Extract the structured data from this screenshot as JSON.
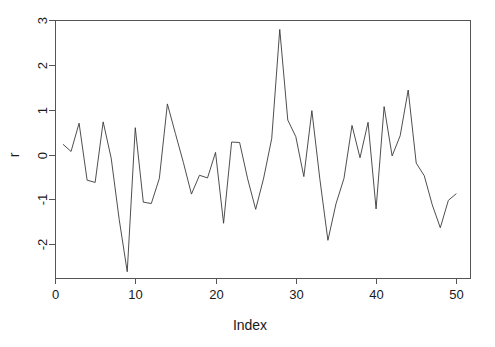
{
  "chart_data": {
    "type": "line",
    "title": "",
    "subtitle": "",
    "xlabel": "Index",
    "ylabel": "r",
    "xlim": [
      0,
      51.7
    ],
    "ylim": [
      -2.75,
      3.0
    ],
    "grid": false,
    "legend": null,
    "annotations": [],
    "x_ticks": [
      0,
      10,
      20,
      30,
      40,
      50
    ],
    "x_tick_labels": [
      "0",
      "10",
      "20",
      "30",
      "40",
      "50"
    ],
    "y_ticks": [
      -2,
      -1,
      0,
      1,
      2,
      3
    ],
    "y_tick_labels": [
      "-2",
      "-1",
      "0",
      "1",
      "2",
      "3"
    ],
    "line_color": "#3a3a3a",
    "axis_color": "#555555",
    "background_color": "#ffffff",
    "x": [
      1,
      2,
      3,
      4,
      5,
      6,
      7,
      8,
      9,
      10,
      11,
      12,
      13,
      14,
      15,
      16,
      17,
      18,
      19,
      20,
      21,
      22,
      23,
      24,
      25,
      26,
      27,
      28,
      29,
      30,
      31,
      32,
      33,
      34,
      35,
      36,
      37,
      38,
      39,
      40,
      41,
      42,
      43,
      44,
      45,
      46,
      47,
      48,
      49,
      50
    ],
    "values": [
      0.23,
      0.07,
      0.7,
      -0.57,
      -0.62,
      0.73,
      -0.08,
      -1.45,
      -2.61,
      0.6,
      -1.06,
      -1.09,
      -0.53,
      1.13,
      0.47,
      -0.18,
      -0.88,
      -0.46,
      -0.52,
      0.05,
      -1.53,
      0.28,
      0.27,
      -0.54,
      -1.22,
      -0.52,
      0.36,
      2.79,
      0.77,
      0.4,
      -0.49,
      0.98,
      -0.55,
      -1.91,
      -1.1,
      -0.53,
      0.65,
      -0.07,
      0.72,
      -1.21,
      1.07,
      -0.03,
      0.42,
      1.44,
      -0.19,
      -0.47,
      -1.12,
      -1.63,
      -1.02,
      -0.87
    ],
    "series": [
      {
        "name": "r",
        "values": [
          0.23,
          0.07,
          0.7,
          -0.57,
          -0.62,
          0.73,
          -0.08,
          -1.45,
          -2.61,
          0.6,
          -1.06,
          -1.09,
          -0.53,
          1.13,
          0.47,
          -0.18,
          -0.88,
          -0.46,
          -0.52,
          0.05,
          -1.53,
          0.28,
          0.27,
          -0.54,
          -1.22,
          -0.52,
          0.36,
          2.79,
          0.77,
          0.4,
          -0.49,
          0.98,
          -0.55,
          -1.91,
          -1.1,
          -0.53,
          0.65,
          -0.07,
          0.72,
          -1.21,
          1.07,
          -0.03,
          0.42,
          1.44,
          -0.19,
          -0.47,
          -1.12,
          -1.63,
          -1.02,
          -0.87
        ]
      }
    ]
  },
  "plot": {
    "box_left": 55,
    "box_right": 470,
    "box_top": 20,
    "box_bottom": 278
  }
}
